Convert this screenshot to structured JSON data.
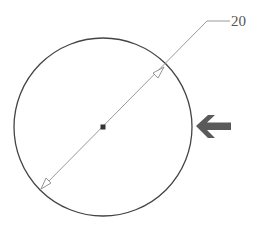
{
  "diagram": {
    "type": "cad-diameter-dimension",
    "circle": {
      "cx": 103,
      "cy": 127,
      "r": 89,
      "stroke": "#444444"
    },
    "center_mark": {
      "x": 103,
      "y": 127,
      "size": 5,
      "fill": "#333333"
    },
    "dimension": {
      "value": "20",
      "line_color": "#9a9a9a",
      "arrow_end_a": {
        "x": 40,
        "y": 190
      },
      "arrow_end_b": {
        "x": 165,
        "y": 66
      },
      "leader_elbow": {
        "x": 207,
        "y": 21
      },
      "leader_end": {
        "x": 230,
        "y": 21
      }
    },
    "pointer_arrow": {
      "icon": "left-arrow-icon",
      "color": "#5a5a5a"
    }
  }
}
